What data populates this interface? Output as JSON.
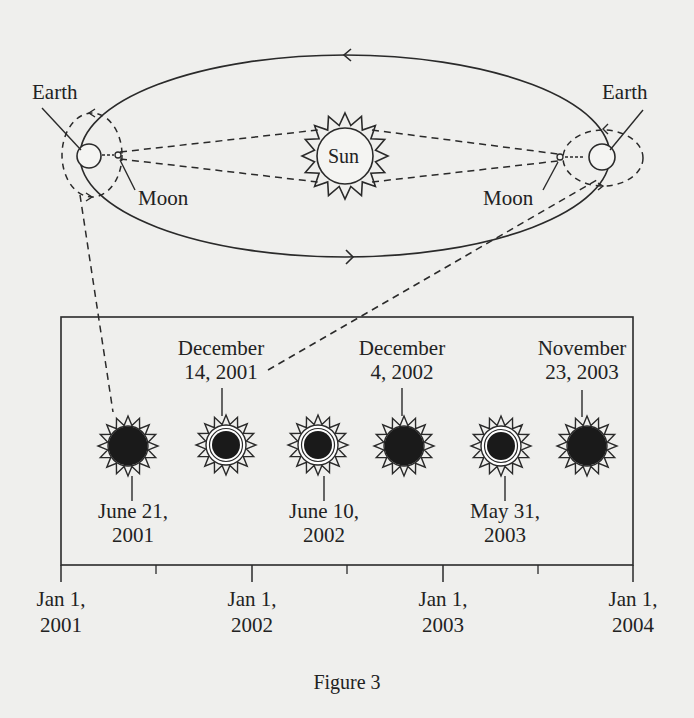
{
  "orbit_diagram": {
    "sun_label": "Sun",
    "left": {
      "earth_label": "Earth",
      "moon_label": "Moon"
    },
    "right": {
      "earth_label": "Earth",
      "moon_label": "Moon"
    }
  },
  "timeline": {
    "eclipses": [
      {
        "date_line1": "June 21,",
        "date_line2": "2001",
        "type": "total",
        "label_position": "below"
      },
      {
        "date_line1": "December",
        "date_line2": "14, 2001",
        "type": "annular",
        "label_position": "above"
      },
      {
        "date_line1": "June 10,",
        "date_line2": "2002",
        "type": "annular",
        "label_position": "below"
      },
      {
        "date_line1": "December",
        "date_line2": "4, 2002",
        "type": "total",
        "label_position": "above"
      },
      {
        "date_line1": "May 31,",
        "date_line2": "2003",
        "type": "annular",
        "label_position": "below"
      },
      {
        "date_line1": "November",
        "date_line2": "23, 2003",
        "type": "total",
        "label_position": "above"
      }
    ],
    "axis_ticks": [
      {
        "line1": "Jan 1,",
        "line2": "2001"
      },
      {
        "line1": "Jan 1,",
        "line2": "2002"
      },
      {
        "line1": "Jan 1,",
        "line2": "2003"
      },
      {
        "line1": "Jan 1,",
        "line2": "2004"
      }
    ]
  },
  "caption": "Figure 3",
  "colors": {
    "ink": "#2a2a2a",
    "background": "#efefed",
    "eclipse_disk": "#1a1a1a"
  }
}
